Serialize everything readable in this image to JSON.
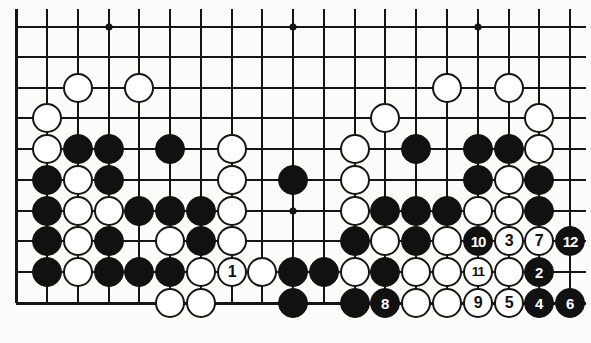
{
  "diagram": {
    "type": "go-board-diagram",
    "board": {
      "columns": 19,
      "rows_shown": 10,
      "line_color": "#151515",
      "background_color": "#fcfcfa",
      "grid": {
        "col_x": [
          16,
          47,
          78,
          109,
          139,
          170,
          201,
          232,
          262,
          293,
          324,
          355,
          385,
          416,
          447,
          478,
          509,
          539,
          570
        ],
        "row_y": [
          27,
          57,
          88,
          118,
          149,
          180,
          211,
          241,
          272,
          303
        ],
        "left_open": false,
        "right_open": true,
        "top_open": true,
        "bottom_edge": true
      },
      "star_points": [
        {
          "col": 4,
          "row": 1
        },
        {
          "col": 10,
          "row": 1
        },
        {
          "col": 16,
          "row": 1
        },
        {
          "col": 10,
          "row": 7
        }
      ]
    },
    "stone_colors": {
      "black": "#111111",
      "white": "#ffffff",
      "outline": "#151515"
    },
    "stones": [
      {
        "col": 3,
        "row": 3,
        "color": "white",
        "label": ""
      },
      {
        "col": 5,
        "row": 3,
        "color": "white",
        "label": ""
      },
      {
        "col": 15,
        "row": 3,
        "color": "white",
        "label": ""
      },
      {
        "col": 17,
        "row": 3,
        "color": "white",
        "label": ""
      },
      {
        "col": 2,
        "row": 4,
        "color": "white",
        "label": ""
      },
      {
        "col": 13,
        "row": 4,
        "color": "white",
        "label": ""
      },
      {
        "col": 18,
        "row": 4,
        "color": "white",
        "label": ""
      },
      {
        "col": 2,
        "row": 5,
        "color": "white",
        "label": ""
      },
      {
        "col": 3,
        "row": 5,
        "color": "black",
        "label": ""
      },
      {
        "col": 4,
        "row": 5,
        "color": "black",
        "label": ""
      },
      {
        "col": 6,
        "row": 5,
        "color": "black",
        "label": ""
      },
      {
        "col": 8,
        "row": 5,
        "color": "white",
        "label": ""
      },
      {
        "col": 12,
        "row": 5,
        "color": "white",
        "label": ""
      },
      {
        "col": 14,
        "row": 5,
        "color": "black",
        "label": ""
      },
      {
        "col": 16,
        "row": 5,
        "color": "black",
        "label": ""
      },
      {
        "col": 17,
        "row": 5,
        "color": "black",
        "label": ""
      },
      {
        "col": 18,
        "row": 5,
        "color": "white",
        "label": ""
      },
      {
        "col": 2,
        "row": 6,
        "color": "black",
        "label": ""
      },
      {
        "col": 3,
        "row": 6,
        "color": "white",
        "label": ""
      },
      {
        "col": 4,
        "row": 6,
        "color": "black",
        "label": ""
      },
      {
        "col": 8,
        "row": 6,
        "color": "white",
        "label": ""
      },
      {
        "col": 10,
        "row": 6,
        "color": "black",
        "label": ""
      },
      {
        "col": 12,
        "row": 6,
        "color": "white",
        "label": ""
      },
      {
        "col": 16,
        "row": 6,
        "color": "black",
        "label": ""
      },
      {
        "col": 17,
        "row": 6,
        "color": "white",
        "label": ""
      },
      {
        "col": 18,
        "row": 6,
        "color": "black",
        "label": ""
      },
      {
        "col": 2,
        "row": 7,
        "color": "black",
        "label": ""
      },
      {
        "col": 3,
        "row": 7,
        "color": "white",
        "label": ""
      },
      {
        "col": 4,
        "row": 7,
        "color": "white",
        "label": ""
      },
      {
        "col": 5,
        "row": 7,
        "color": "black",
        "label": ""
      },
      {
        "col": 6,
        "row": 7,
        "color": "black",
        "label": ""
      },
      {
        "col": 7,
        "row": 7,
        "color": "black",
        "label": ""
      },
      {
        "col": 8,
        "row": 7,
        "color": "white",
        "label": ""
      },
      {
        "col": 12,
        "row": 7,
        "color": "white",
        "label": ""
      },
      {
        "col": 13,
        "row": 7,
        "color": "black",
        "label": ""
      },
      {
        "col": 14,
        "row": 7,
        "color": "black",
        "label": ""
      },
      {
        "col": 15,
        "row": 7,
        "color": "black",
        "label": ""
      },
      {
        "col": 16,
        "row": 7,
        "color": "white",
        "label": ""
      },
      {
        "col": 17,
        "row": 7,
        "color": "white",
        "label": ""
      },
      {
        "col": 18,
        "row": 7,
        "color": "black",
        "label": ""
      },
      {
        "col": 2,
        "row": 8,
        "color": "black",
        "label": ""
      },
      {
        "col": 3,
        "row": 8,
        "color": "white",
        "label": ""
      },
      {
        "col": 4,
        "row": 8,
        "color": "black",
        "label": ""
      },
      {
        "col": 6,
        "row": 8,
        "color": "white",
        "label": ""
      },
      {
        "col": 7,
        "row": 8,
        "color": "black",
        "label": ""
      },
      {
        "col": 8,
        "row": 8,
        "color": "white",
        "label": ""
      },
      {
        "col": 12,
        "row": 8,
        "color": "black",
        "label": ""
      },
      {
        "col": 13,
        "row": 8,
        "color": "white",
        "label": ""
      },
      {
        "col": 14,
        "row": 8,
        "color": "black",
        "label": ""
      },
      {
        "col": 15,
        "row": 8,
        "color": "white",
        "label": ""
      },
      {
        "col": 16,
        "row": 8,
        "color": "black",
        "label": "10"
      },
      {
        "col": 17,
        "row": 8,
        "color": "white",
        "label": "3"
      },
      {
        "col": 18,
        "row": 8,
        "color": "white",
        "label": "7"
      },
      {
        "col": 19,
        "row": 8,
        "color": "black",
        "label": "12"
      },
      {
        "col": 2,
        "row": 9,
        "color": "black",
        "label": ""
      },
      {
        "col": 3,
        "row": 9,
        "color": "white",
        "label": ""
      },
      {
        "col": 4,
        "row": 9,
        "color": "black",
        "label": ""
      },
      {
        "col": 5,
        "row": 9,
        "color": "black",
        "label": ""
      },
      {
        "col": 6,
        "row": 9,
        "color": "black",
        "label": ""
      },
      {
        "col": 7,
        "row": 9,
        "color": "white",
        "label": ""
      },
      {
        "col": 8,
        "row": 9,
        "color": "white",
        "label": "1"
      },
      {
        "col": 9,
        "row": 9,
        "color": "white",
        "label": ""
      },
      {
        "col": 10,
        "row": 9,
        "color": "black",
        "label": ""
      },
      {
        "col": 11,
        "row": 9,
        "color": "black",
        "label": ""
      },
      {
        "col": 12,
        "row": 9,
        "color": "white",
        "label": ""
      },
      {
        "col": 13,
        "row": 9,
        "color": "black",
        "label": ""
      },
      {
        "col": 14,
        "row": 9,
        "color": "white",
        "label": ""
      },
      {
        "col": 15,
        "row": 9,
        "color": "white",
        "label": ""
      },
      {
        "col": 16,
        "row": 9,
        "color": "white",
        "label": "11"
      },
      {
        "col": 17,
        "row": 9,
        "color": "white",
        "label": ""
      },
      {
        "col": 18,
        "row": 9,
        "color": "black",
        "label": "2"
      },
      {
        "col": 6,
        "row": 10,
        "color": "white",
        "label": ""
      },
      {
        "col": 7,
        "row": 10,
        "color": "white",
        "label": ""
      },
      {
        "col": 10,
        "row": 10,
        "color": "black",
        "label": ""
      },
      {
        "col": 12,
        "row": 10,
        "color": "black",
        "label": ""
      },
      {
        "col": 13,
        "row": 10,
        "color": "black",
        "label": "8"
      },
      {
        "col": 14,
        "row": 10,
        "color": "white",
        "label": ""
      },
      {
        "col": 15,
        "row": 10,
        "color": "white",
        "label": ""
      },
      {
        "col": 16,
        "row": 10,
        "color": "white",
        "label": "9"
      },
      {
        "col": 17,
        "row": 10,
        "color": "white",
        "label": "5"
      },
      {
        "col": 18,
        "row": 10,
        "color": "black",
        "label": "4"
      },
      {
        "col": 19,
        "row": 10,
        "color": "black",
        "label": "6"
      }
    ],
    "move_numbers": [
      "1",
      "2",
      "3",
      "4",
      "5",
      "6",
      "7",
      "8",
      "9",
      "10",
      "11",
      "12"
    ]
  }
}
